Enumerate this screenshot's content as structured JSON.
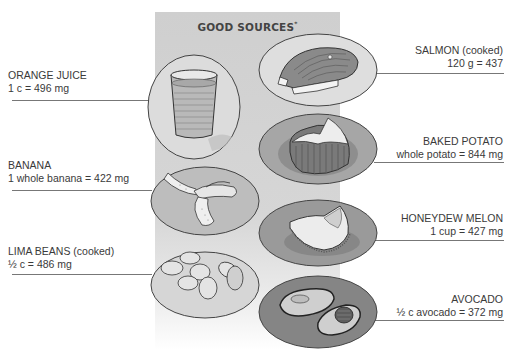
{
  "panel": {
    "title": "GOOD SOURCES",
    "title_marker": "*"
  },
  "items": [
    {
      "id": "orange-juice",
      "name": "ORANGE JUICE",
      "amount": "1 c = 496 mg",
      "side": "left",
      "icon": "glass-of-juice-icon"
    },
    {
      "id": "banana",
      "name": "BANANA",
      "amount": "1 whole banana = 422 mg",
      "side": "left",
      "icon": "peeled-banana-icon"
    },
    {
      "id": "lima-beans",
      "name": "LIMA BEANS (cooked)",
      "amount": "½ c = 486 mg",
      "side": "left",
      "icon": "lima-beans-icon"
    },
    {
      "id": "salmon",
      "name": "SALMON (cooked)",
      "amount": "120 g = 437",
      "side": "right",
      "icon": "salmon-steak-icon"
    },
    {
      "id": "baked-potato",
      "name": "BAKED POTATO",
      "amount": "whole potato = 844 mg",
      "side": "right",
      "icon": "baked-potato-icon"
    },
    {
      "id": "honeydew-melon",
      "name": "HONEYDEW MELON",
      "amount": "1 cup = 427 mg",
      "side": "right",
      "icon": "melon-slice-icon"
    },
    {
      "id": "avocado",
      "name": "AVOCADO",
      "amount": "½ c avocado = 372 mg",
      "side": "right",
      "icon": "avocado-halves-icon"
    }
  ],
  "colors": {
    "panel_gray": "#d2d2d2",
    "plate_light": "#d9d9d9",
    "plate_dark": "#8f8f8f",
    "text": "#3a3a3a",
    "rule": "#777777"
  }
}
